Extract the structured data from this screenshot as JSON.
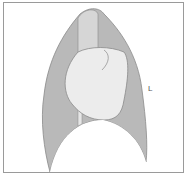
{
  "diagram": {
    "type": "lateral chest anatomical schematic",
    "labels": {
      "side_marker": "L"
    },
    "colors": {
      "lung_fill": "#b9b9b9",
      "trachea_fill": "#d6d6d6",
      "heart_fill": "#ececec",
      "outline": "#8a8a8a",
      "frame": "#9a9a9a",
      "background": "#ffffff"
    }
  }
}
